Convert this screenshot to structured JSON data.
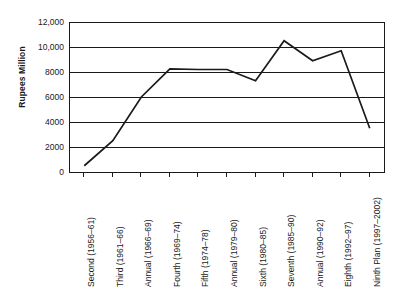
{
  "chart_data": {
    "type": "line",
    "title": "",
    "xlabel": "",
    "ylabel": "Rupees Million",
    "ylim": [
      0,
      12000
    ],
    "yticks": [
      0,
      2000,
      4000,
      6000,
      8000,
      10000,
      12000
    ],
    "ytick_labels": [
      "0",
      "2000",
      "4000",
      "6000",
      "8000",
      "10,000",
      "12,000"
    ],
    "grid": "horizontal",
    "legend": "none",
    "line_color": "#1a1a1a",
    "categories": [
      "Second (1956–61)",
      "Third (1961–66)",
      "Annual (1966–69)",
      "Fourth (1969–74)",
      "Fifth (1974–78)",
      "Annual (1979–80)",
      "Sixth (1980–85)",
      "Seventh (1985–90)",
      "Annual (1990–92)",
      "Eighth (1992–97)",
      "Ninth Plan (1997–2002)"
    ],
    "values": [
      500,
      2500,
      6000,
      8250,
      8200,
      8200,
      7300,
      10500,
      8900,
      9700,
      3500
    ],
    "series": [
      {
        "name": "Rupees Million",
        "values": [
          500,
          2500,
          6000,
          8250,
          8200,
          8200,
          7300,
          10500,
          8900,
          9700,
          3500
        ]
      }
    ]
  }
}
